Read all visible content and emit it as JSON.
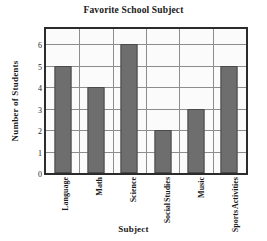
{
  "chart_data": {
    "type": "bar",
    "title": "Favorite School Subject",
    "xlabel": "Subject",
    "ylabel": "Number of Students",
    "categories": [
      "Language",
      "Math",
      "Science",
      "Social Studies",
      "Music",
      "Sports Activities"
    ],
    "category_lines": [
      [
        "Language"
      ],
      [
        "Math"
      ],
      [
        "Science"
      ],
      [
        "Social",
        "Studies"
      ],
      [
        "Music"
      ],
      [
        "Sports",
        "Activities"
      ]
    ],
    "values": [
      5,
      4,
      6,
      2,
      3,
      5
    ],
    "ylim": [
      0,
      6.7
    ],
    "yticks": [
      6,
      5,
      4,
      3,
      2,
      1,
      0
    ],
    "grid": true,
    "legend": "none",
    "colors": {
      "bar_fill": "#6e6e6e",
      "bar_edge": "#4a4a4a",
      "grid": "#8d8d8d",
      "frame": "#2b2b2b",
      "plot_background": "#fbfbfb",
      "text": "#1a1a1a"
    }
  }
}
